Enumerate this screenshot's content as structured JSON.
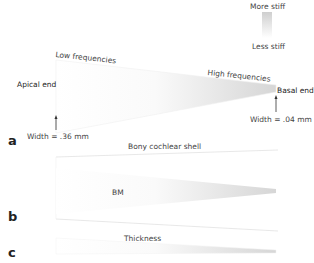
{
  "legend": {
    "top_label": "More stiff",
    "bottom_label": "Less stiff",
    "gradient_top": "#d0d0d0",
    "gradient_bottom": "#ffffff"
  },
  "panel_a": {
    "letter": "a",
    "apical_label": "Apical end",
    "basal_label": "Basal end",
    "low_freq_label": "Low frequencies",
    "high_freq_label": "High frequencies",
    "apical_width_label": "Width = .36 mm",
    "basal_width_label": "Width = .04 mm"
  },
  "panel_b": {
    "letter": "b",
    "shell_label": "Bony cochlear shell",
    "bm_label": "BM"
  },
  "panel_c": {
    "letter": "c",
    "thickness_label": "Thickness"
  },
  "colors": {
    "stiff": "#cfcfcf",
    "soft": "#ffffff",
    "outline": "#e6e6e6",
    "arrow": "#333333"
  }
}
